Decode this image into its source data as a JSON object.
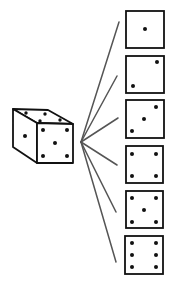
{
  "diagram": {
    "colors": {
      "stroke": "#111111",
      "fan_line": "#555555",
      "background": "#ffffff"
    },
    "cube": {
      "front_face_pips": 5,
      "top_face_pips": 4,
      "left_face_pips": 1
    },
    "faces": [
      {
        "value": 1,
        "label": "one"
      },
      {
        "value": 2,
        "label": "two"
      },
      {
        "value": 3,
        "label": "three"
      },
      {
        "value": 4,
        "label": "four"
      },
      {
        "value": 5,
        "label": "five"
      },
      {
        "value": 6,
        "label": "six"
      }
    ]
  }
}
